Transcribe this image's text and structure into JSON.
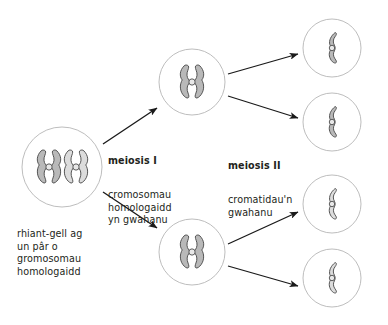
{
  "diagram": {
    "title_text": "",
    "colors": {
      "background": "#ffffff",
      "cell_outline": "#b5b5b5",
      "chromosome_fill_dark": "#b9b9b9",
      "chromosome_fill_light": "#dcdcdc",
      "chromosome_outline": "#4d4d4d",
      "centromere_fill": "#e8e8e8",
      "arrow": "#1a1a1a",
      "text": "#231f20"
    },
    "labels": {
      "meiosis_one": {
        "heading": "meiosis I",
        "body": "cromosomau\nhomologaidd\nyn gwahanu"
      },
      "meiosis_two": {
        "heading": "meiosis II",
        "body": "cromatidau'n\ngwahanu"
      },
      "parent_cell": {
        "caption": "rhiant-gell ag\nun pâr o\ngromosomau\nhomologaidd"
      }
    },
    "cells": [
      {
        "name": "parent-cell",
        "cx": 62,
        "cy": 167,
        "r": 40,
        "stage": "rhiant-gell",
        "chromosome_count": 2,
        "chromosome_type": "replicated-homologous-pair"
      },
      {
        "name": "meiosis-one-daughter-cell-top",
        "cx": 192,
        "cy": 82,
        "r": 33,
        "stage": "meiosis I",
        "chromosome_count": 1,
        "chromosome_type": "replicated-chromosome"
      },
      {
        "name": "meiosis-one-daughter-cell-bottom",
        "cx": 192,
        "cy": 252,
        "r": 33,
        "stage": "meiosis I",
        "chromosome_count": 1,
        "chromosome_type": "replicated-chromosome"
      },
      {
        "name": "gamete-cell-1",
        "cx": 332,
        "cy": 48,
        "r": 29,
        "stage": "meiosis II",
        "chromosome_count": 1,
        "chromosome_type": "single-chromatid",
        "shade": "dark"
      },
      {
        "name": "gamete-cell-2",
        "cx": 332,
        "cy": 122,
        "r": 29,
        "stage": "meiosis II",
        "chromosome_count": 1,
        "chromosome_type": "single-chromatid",
        "shade": "dark"
      },
      {
        "name": "gamete-cell-3",
        "cx": 332,
        "cy": 204,
        "r": 29,
        "stage": "meiosis II",
        "chromosome_count": 1,
        "chromosome_type": "single-chromatid",
        "shade": "light"
      },
      {
        "name": "gamete-cell-4",
        "cx": 332,
        "cy": 278,
        "r": 29,
        "stage": "meiosis II",
        "chromosome_count": 1,
        "chromosome_type": "single-chromatid",
        "shade": "light"
      }
    ],
    "arrows": [
      {
        "name": "arrow-parent-to-top",
        "x1": 103,
        "y1": 144,
        "x2": 157,
        "y2": 108
      },
      {
        "name": "arrow-parent-to-bottom",
        "x1": 103,
        "y1": 192,
        "x2": 157,
        "y2": 228
      },
      {
        "name": "arrow-top-to-gamete-1",
        "x1": 228,
        "y1": 74,
        "x2": 298,
        "y2": 54
      },
      {
        "name": "arrow-top-to-gamete-2",
        "x1": 228,
        "y1": 96,
        "x2": 298,
        "y2": 118
      },
      {
        "name": "arrow-bottom-to-gamete-3",
        "x1": 228,
        "y1": 244,
        "x2": 298,
        "y2": 212
      },
      {
        "name": "arrow-bottom-to-gamete-4",
        "x1": 228,
        "y1": 266,
        "x2": 298,
        "y2": 286
      }
    ]
  }
}
